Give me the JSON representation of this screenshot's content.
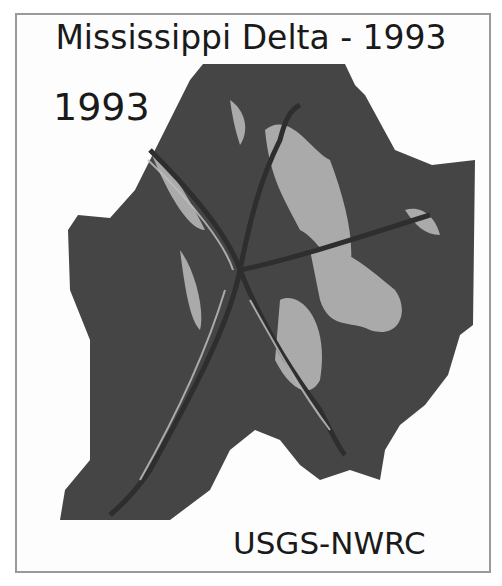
{
  "map": {
    "title": "Mississippi Delta - 1993",
    "year_label": "1993",
    "credit": "USGS-NWRC",
    "colors": {
      "water": "#444444",
      "land": "#b8b8b8",
      "channel": "#2e2e2e",
      "border": "#9a9a9a",
      "background": "#fdfdfd"
    }
  }
}
